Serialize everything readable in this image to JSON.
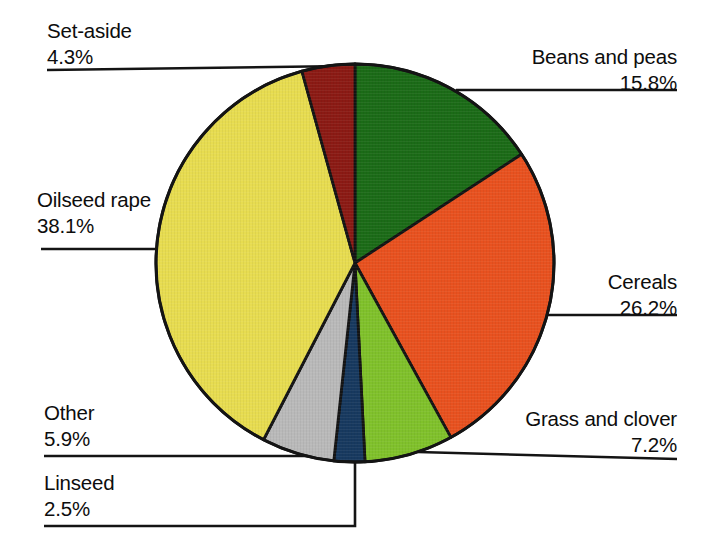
{
  "chart_data": {
    "type": "pie",
    "title": "",
    "subtitle": "",
    "xlabel": "",
    "ylabel": "",
    "legend_position": "callout-labels",
    "grid": false,
    "unit": "%",
    "total": 100.0,
    "start_angle_deg": 0,
    "direction": "clockwise",
    "categories": [
      "Beans and peas",
      "Cereals",
      "Grass and clover",
      "Linseed",
      "Other",
      "Oilseed rape",
      "Set-aside"
    ],
    "values": [
      15.8,
      26.2,
      7.2,
      2.5,
      5.9,
      38.1,
      4.3
    ],
    "colors": [
      "#1b6b17",
      "#e8511f",
      "#80c12b",
      "#17395f",
      "#b9b9b9",
      "#e7dc50",
      "#8b1a14"
    ],
    "slices": [
      {
        "label": "Beans and peas",
        "value": 15.8,
        "value_text": "15.8%",
        "color": "#1b6b17"
      },
      {
        "label": "Cereals",
        "value": 26.2,
        "value_text": "26.2%",
        "color": "#e8511f"
      },
      {
        "label": "Grass and clover",
        "value": 7.2,
        "value_text": "7.2%",
        "color": "#80c12b"
      },
      {
        "label": "Linseed",
        "value": 2.5,
        "value_text": "2.5%",
        "color": "#17395f"
      },
      {
        "label": "Other",
        "value": 5.9,
        "value_text": "5.9%",
        "color": "#b9b9b9"
      },
      {
        "label": "Oilseed rape",
        "value": 38.1,
        "value_text": "38.1%",
        "color": "#e7dc50"
      },
      {
        "label": "Set-aside",
        "value": 4.3,
        "value_text": "4.3%",
        "color": "#8b1a14"
      }
    ]
  },
  "labels": {
    "set_aside": {
      "name": "Set-aside",
      "value": "4.3%"
    },
    "oilseed_rape": {
      "name": "Oilseed rape",
      "value": "38.1%"
    },
    "other": {
      "name": "Other",
      "value": "5.9%"
    },
    "linseed": {
      "name": "Linseed",
      "value": "2.5%"
    },
    "beans_and_peas": {
      "name": "Beans and peas",
      "value": "15.8%"
    },
    "cereals": {
      "name": "Cereals",
      "value": "26.2%"
    },
    "grass_clover": {
      "name": "Grass and clover",
      "value": "7.2%"
    }
  },
  "style": {
    "background": "#ffffff",
    "text_color": "#0d0d0d",
    "outline_color": "#141414"
  }
}
